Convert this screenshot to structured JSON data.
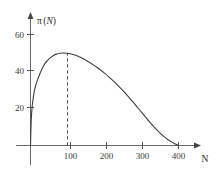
{
  "chart_data": {
    "type": "line",
    "title": "",
    "xlabel": "N",
    "ylabel": "π(N)",
    "ylabel_parts": {
      "greek": "π",
      "open": "(",
      "var": "N",
      "close": ")"
    },
    "xlim": [
      0,
      440
    ],
    "ylim": [
      0,
      68
    ],
    "grid": false,
    "legend": null,
    "xticks": [
      100,
      200,
      300,
      400
    ],
    "xtick_labels": [
      "100",
      "200",
      "300",
      "400"
    ],
    "yticks": [
      20,
      40,
      60
    ],
    "ytick_labels": [
      "20",
      "40",
      "60"
    ],
    "series": [
      {
        "name": "π(N)",
        "color": "#3d3d3d",
        "x": [
          0,
          2,
          5,
          10,
          15,
          20,
          30,
          40,
          50,
          60,
          70,
          80,
          90,
          100,
          110,
          120,
          130,
          140,
          150,
          160,
          170,
          180,
          190,
          200,
          210,
          220,
          230,
          240,
          250,
          260,
          270,
          280,
          290,
          300,
          310,
          320,
          330,
          340,
          350,
          360,
          370,
          380,
          390,
          400
        ],
        "y": [
          0,
          14,
          22,
          29,
          33,
          36,
          41,
          44.5,
          46.8,
          48.4,
          49.4,
          49.9,
          50,
          49.9,
          49.5,
          48.9,
          48.1,
          47.2,
          46.1,
          44.9,
          43.6,
          42.2,
          40.7,
          39.1,
          37.4,
          35.6,
          33.7,
          31.7,
          29.6,
          27.4,
          25.1,
          22.8,
          20.4,
          18,
          15.6,
          13.2,
          10.9,
          8.7,
          6.7,
          4.9,
          3.4,
          2.1,
          1,
          0
        ]
      }
    ],
    "annotations": [
      {
        "type": "dashed-vertical",
        "name": "peak-dashed-line",
        "x": 100,
        "y_from": 0,
        "y_to": 50,
        "color": "#4a4a4a"
      }
    ],
    "peak": {
      "x": 100,
      "y": 50
    },
    "x_intercept": 400
  },
  "axes": {
    "x_axis_name": "x-axis",
    "y_axis_name": "y-axis",
    "axis_color": "#555555"
  }
}
